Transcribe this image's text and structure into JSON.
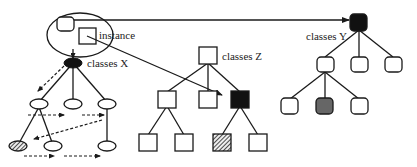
{
  "labels": {
    "instance": "instance",
    "classes_x": "classes X",
    "classes_y": "classes Y",
    "classes_z": "classes Z"
  },
  "colors": {
    "line": "#1a1a1a",
    "black_node": "#111111",
    "gray_node": "#666666",
    "background": "#ffffff"
  },
  "trees": [
    {
      "name": "classes X",
      "node_shape": "ellipse",
      "root": "black",
      "hatched_leaf": true,
      "dashed_traversal_arrows": true
    },
    {
      "name": "classes Z",
      "node_shape": "square",
      "highlighted_node": "black",
      "hatched_leaf": true
    },
    {
      "name": "classes Y",
      "node_shape": "rounded-square",
      "root": "black",
      "gray_leaf": true
    }
  ]
}
